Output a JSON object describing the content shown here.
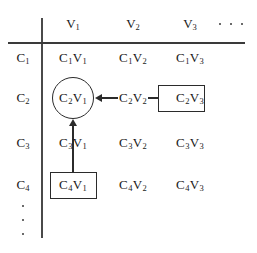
{
  "figure": {
    "ink_color": "#2b2b2b",
    "rule_color": "#3a3a3a",
    "background": "#ffffff"
  },
  "column_headers": [
    {
      "label": "V",
      "sub": "1",
      "x": 73
    },
    {
      "label": "V",
      "sub": "2",
      "x": 133
    },
    {
      "label": "V",
      "sub": "3",
      "x": 190
    }
  ],
  "column_ellipsis": {
    "name": "column-ellipsis",
    "dots": 3,
    "x_positions": [
      219,
      230,
      241
    ],
    "y": 24
  },
  "row_headers": [
    {
      "label": "C",
      "sub": "1",
      "y": 58
    },
    {
      "label": "C",
      "sub": "2",
      "y": 98
    },
    {
      "label": "C",
      "sub": "3",
      "y": 143
    },
    {
      "label": "C",
      "sub": "4",
      "y": 185
    }
  ],
  "row_ellipsis": {
    "name": "row-ellipsis",
    "dots": 3,
    "x": 23,
    "y_positions": [
      206,
      220,
      234
    ]
  },
  "cells": [
    {
      "c": "1",
      "v": "1",
      "text_c": "C",
      "text_v": "V",
      "x": 73,
      "y": 58,
      "mark": "none"
    },
    {
      "c": "1",
      "v": "2",
      "text_c": "C",
      "text_v": "V",
      "x": 133,
      "y": 58,
      "mark": "none"
    },
    {
      "c": "1",
      "v": "3",
      "text_c": "C",
      "text_v": "V",
      "x": 190,
      "y": 58,
      "mark": "none"
    },
    {
      "c": "2",
      "v": "1",
      "text_c": "C",
      "text_v": "V",
      "x": 73,
      "y": 98,
      "mark": "circle"
    },
    {
      "c": "2",
      "v": "2",
      "text_c": "C",
      "text_v": "V",
      "x": 133,
      "y": 98,
      "mark": "none"
    },
    {
      "c": "2",
      "v": "3",
      "text_c": "C",
      "text_v": "V",
      "x": 190,
      "y": 98,
      "mark": "box"
    },
    {
      "c": "3",
      "v": "1",
      "text_c": "C",
      "text_v": "V",
      "x": 73,
      "y": 143,
      "mark": "none"
    },
    {
      "c": "3",
      "v": "2",
      "text_c": "C",
      "text_v": "V",
      "x": 133,
      "y": 143,
      "mark": "none"
    },
    {
      "c": "3",
      "v": "3",
      "text_c": "C",
      "text_v": "V",
      "x": 190,
      "y": 143,
      "mark": "none"
    },
    {
      "c": "4",
      "v": "1",
      "text_c": "C",
      "text_v": "V",
      "x": 73,
      "y": 185,
      "mark": "box"
    },
    {
      "c": "4",
      "v": "2",
      "text_c": "C",
      "text_v": "V",
      "x": 133,
      "y": 185,
      "mark": "none"
    },
    {
      "c": "4",
      "v": "3",
      "text_c": "C",
      "text_v": "V",
      "x": 190,
      "y": 185,
      "mark": "none"
    }
  ],
  "marks": {
    "circle_c2v1": {
      "name": "circle-highlight-c2v1",
      "cx": 73,
      "cy": 98,
      "r": 21
    },
    "box_c2v3": {
      "name": "box-highlight-c2v3",
      "x": 158,
      "y": 85,
      "w": 47,
      "h": 27
    },
    "box_c4v1": {
      "name": "box-highlight-c4v1",
      "x": 50,
      "y": 172,
      "w": 47,
      "h": 27
    }
  },
  "connectors": [
    {
      "name": "arrow-c2v2-to-c2v1",
      "orientation": "horizontal",
      "from": "C2V2",
      "to": "C2V1",
      "direction": "left"
    },
    {
      "name": "link-c2v3-to-c2v2",
      "orientation": "horizontal",
      "from": "C2V3",
      "to": "C2V2",
      "direction": "none"
    },
    {
      "name": "arrow-c4v1-to-c2v1",
      "orientation": "vertical",
      "from": "C4V1",
      "to": "C2V1",
      "direction": "up"
    }
  ],
  "axes": {
    "vertical_rule": {
      "name": "vertical-divider",
      "x": 41,
      "y": 18,
      "h": 220,
      "w": 1.6
    },
    "horizontal_rule": {
      "name": "horizontal-divider",
      "x": 8,
      "y": 42,
      "w": 237,
      "h": 1.6
    }
  }
}
